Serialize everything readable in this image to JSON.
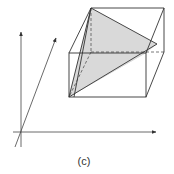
{
  "figure": {
    "caption": "(c)",
    "colors": {
      "stroke": "#333333",
      "fill": "#d9d9d9",
      "axis": "#444444"
    },
    "axes": {
      "origin": [
        21,
        132
      ],
      "x_axis": {
        "from": [
          13,
          132
        ],
        "to": [
          156,
          132
        ]
      },
      "y_axis": {
        "from": [
          21,
          147
        ],
        "to": [
          21,
          32
        ]
      },
      "z_axis": {
        "from": [
          15,
          147
        ],
        "to": [
          56,
          38
        ]
      }
    },
    "cube": {
      "front_face": [
        [
          69,
          53
        ],
        [
          146,
          53
        ],
        [
          146,
          97
        ],
        [
          69,
          97
        ]
      ],
      "back_face": [
        [
          91,
          8
        ],
        [
          164,
          8
        ],
        [
          164,
          52
        ],
        [
          91,
          52
        ]
      ],
      "hidden_edges": [
        [
          [
            91,
            8
          ],
          [
            91,
            52
          ]
        ],
        [
          [
            91,
            52
          ],
          [
            164,
            52
          ]
        ],
        [
          [
            91,
            52
          ],
          [
            69,
            97
          ]
        ]
      ]
    },
    "shaded_plane": {
      "vertices": [
        [
          91,
          8
        ],
        [
          157,
          44
        ],
        [
          69,
          97
        ]
      ],
      "inner_vertex": [
        146,
        53
      ]
    }
  }
}
